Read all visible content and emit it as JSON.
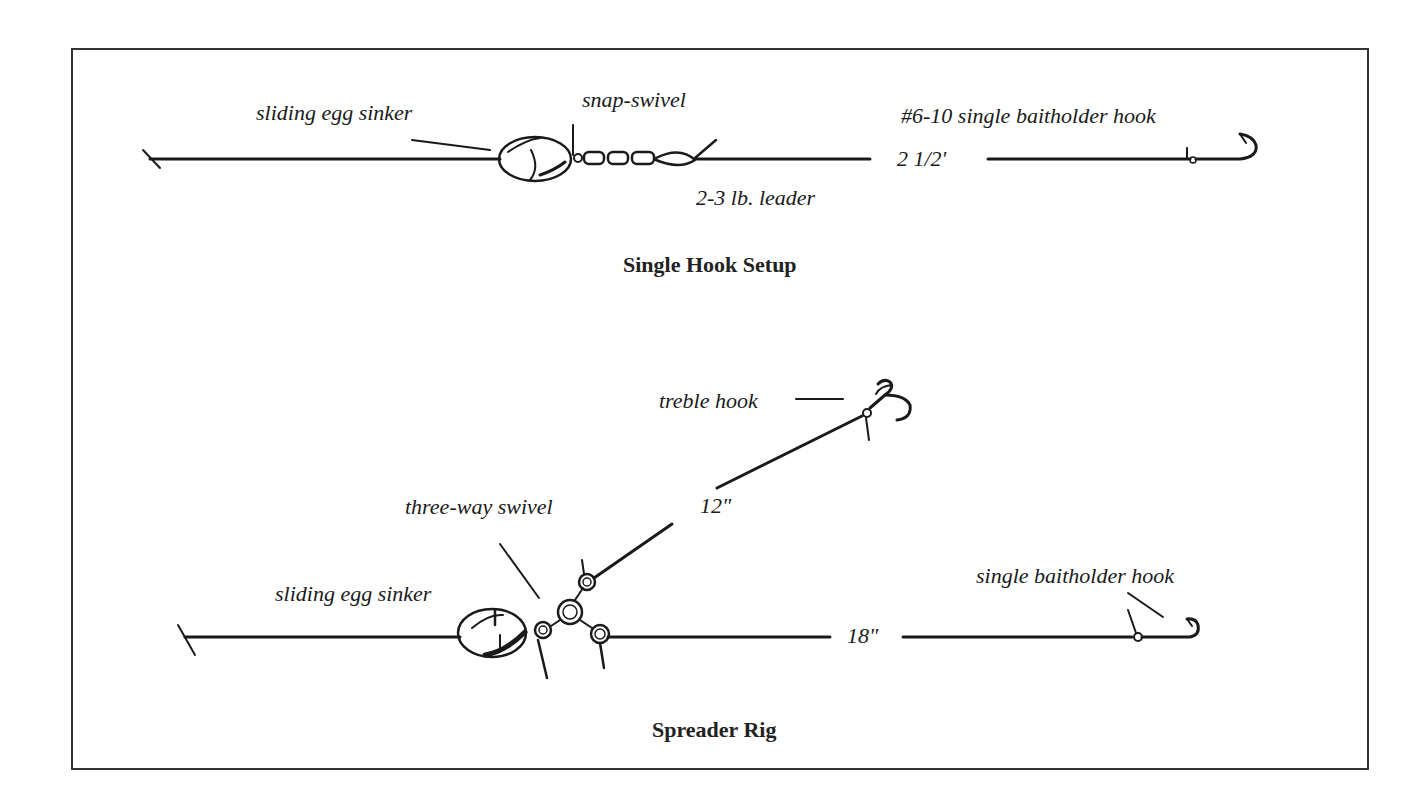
{
  "diagram": {
    "type": "fishing-rig-illustration",
    "panels": [
      {
        "caption": "Single Hook Setup",
        "labels": {
          "sinker": "sliding egg sinker",
          "swivel": "snap-swivel",
          "leader": "2-3 lb. leader",
          "length": "2 1/2'",
          "hook": "#6-10 single baitholder hook"
        }
      },
      {
        "caption": "Spreader Rig",
        "labels": {
          "treble": "treble hook",
          "upper_length": "12\"",
          "swivel": "three-way swivel",
          "sinker": "sliding egg sinker",
          "hook": "single baitholder hook",
          "lower_length": "18\""
        }
      }
    ],
    "colors": {
      "ink": "#1a1a1a",
      "frame": "#333333",
      "background": "#ffffff"
    }
  }
}
